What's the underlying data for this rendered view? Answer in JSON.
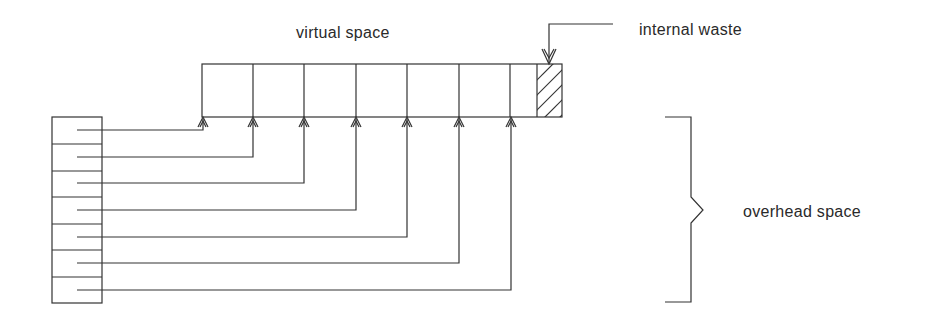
{
  "diagram": {
    "labels": {
      "virtual_space": "virtual space",
      "internal_waste": "internal waste",
      "overhead_space": "overhead space"
    },
    "virtual_space": {
      "page_count": 7,
      "page_boundaries_x": [
        202,
        253,
        304,
        356,
        407,
        459,
        510,
        537
      ],
      "waste_block": {
        "x1": 537,
        "x2": 562,
        "hatched": true
      },
      "top_y": 64,
      "bottom_y": 117
    },
    "page_table": {
      "entries": 7,
      "x1": 52,
      "x2": 102,
      "top_y": 117,
      "bottom_y": 303,
      "row_dividers_y": [
        144,
        171,
        197,
        224,
        250,
        277
      ],
      "pointer_rows_y": [
        130,
        157,
        183,
        210,
        237,
        263,
        290
      ]
    },
    "pointers": [
      {
        "from_entry": 1,
        "to_page": 1,
        "target_x": 203,
        "row_y": 130
      },
      {
        "from_entry": 2,
        "to_page": 2,
        "target_x": 253,
        "row_y": 157
      },
      {
        "from_entry": 3,
        "to_page": 3,
        "target_x": 304,
        "row_y": 183
      },
      {
        "from_entry": 4,
        "to_page": 4,
        "target_x": 356,
        "row_y": 210
      },
      {
        "from_entry": 5,
        "to_page": 5,
        "target_x": 407,
        "row_y": 237
      },
      {
        "from_entry": 6,
        "to_page": 6,
        "target_x": 459,
        "row_y": 263
      },
      {
        "from_entry": 7,
        "to_page": 7,
        "target_x": 511,
        "row_y": 290
      }
    ],
    "colors": {
      "line": "#333333",
      "text": "#2a2a2a",
      "background": "#ffffff"
    }
  }
}
